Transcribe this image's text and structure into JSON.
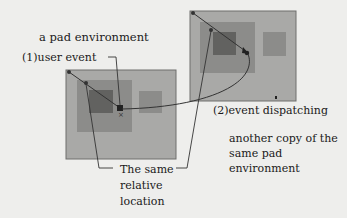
{
  "diagram": {
    "labels": {
      "pad_environment": "a pad environment",
      "user_event": "(1)user event",
      "event_dispatching": "(2)event dispatching",
      "another_copy": "another copy of the same pad environment",
      "same_relative_location": "The same relative location"
    },
    "left_pad": {
      "outer": {
        "x": 66,
        "y": 70,
        "w": 110,
        "h": 89
      },
      "medium": {
        "x": 77,
        "y": 80,
        "w": 55,
        "h": 52
      },
      "dark": {
        "x": 89,
        "y": 90,
        "w": 24,
        "h": 23
      },
      "side": {
        "x": 139,
        "y": 91,
        "w": 23,
        "h": 22
      }
    },
    "right_pad": {
      "outer": {
        "x": 190,
        "y": 11,
        "w": 106,
        "h": 90
      },
      "medium": {
        "x": 200,
        "y": 22,
        "w": 55,
        "h": 51
      },
      "dark": {
        "x": 213,
        "y": 32,
        "w": 23,
        "h": 23
      },
      "side": {
        "x": 263,
        "y": 32,
        "w": 23,
        "h": 24
      }
    },
    "colors": {
      "background": "#eeeeec",
      "outer": "#a9a9a7",
      "medium": "#8c8c8a",
      "dark": "#626260",
      "side": "#8c8c8a",
      "line": "#333333"
    }
  }
}
